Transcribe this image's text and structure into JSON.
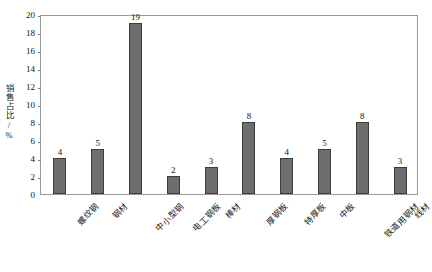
{
  "chart_data": {
    "type": "bar",
    "title": "",
    "subtitle": "",
    "xlabel": "",
    "ylabel": "销售占比/%",
    "ylim": [
      0,
      20
    ],
    "ytick_step": 2,
    "yticks": [
      "0",
      "2",
      "4",
      "6",
      "8",
      "10",
      "12",
      "14",
      "16",
      "18",
      "20"
    ],
    "grid": false,
    "legend": false,
    "legend_position": "none",
    "bar_color": "#6e6e6e",
    "bar_edge_color": "#3c3c3c",
    "frame_color": "#9a9a9a",
    "xlabel_rotation": -45,
    "categories": [
      "螺纹钢",
      "钢材",
      "中小型钢",
      "电工钢板",
      "棒材",
      "厚钢板",
      "特厚板",
      "中板",
      "铁道用钢材",
      "线材"
    ],
    "values": [
      4,
      5,
      19,
      2,
      3,
      8,
      4,
      5,
      8,
      3
    ],
    "value_labels": [
      "4",
      "5",
      "19",
      "2",
      "3",
      "8",
      "4",
      "5",
      "8",
      "3"
    ]
  }
}
